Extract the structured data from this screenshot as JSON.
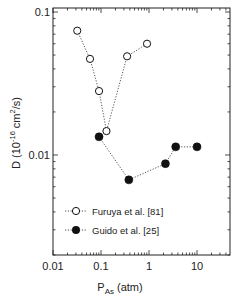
{
  "chart_data": {
    "type": "scatter",
    "title": "",
    "xlabel": "P_As (atm)",
    "xlabel_main": "P",
    "xlabel_sub": "As",
    "xlabel_unit": " (atm)",
    "ylabel": "D (10^-16 cm^2/s)",
    "ylabel_prefix": "D (10",
    "ylabel_exp": "-16",
    "ylabel_mid": " cm",
    "ylabel_sq": "2",
    "ylabel_suffix": "/s)",
    "xscale": "log",
    "yscale": "log",
    "xlim": [
      0.01,
      50
    ],
    "ylim": [
      0.002,
      0.11
    ],
    "xticks": [
      "0.01",
      "0.1",
      "1",
      "10"
    ],
    "xtick_values": [
      0.01,
      0.1,
      1,
      10
    ],
    "yticks": [
      "0.1",
      "0.01"
    ],
    "ytick_values": [
      0.1,
      0.01
    ],
    "grid": false,
    "legend_position": "lower left inside",
    "series": [
      {
        "name": "Furuya et al. [81]",
        "marker": "open-circle",
        "line": "dotted",
        "x": [
          0.032,
          0.059,
          0.091,
          0.13,
          0.35,
          0.91
        ],
        "y": [
          0.074,
          0.047,
          0.028,
          0.0147,
          0.049,
          0.06
        ]
      },
      {
        "name": "Guido et al. [25]",
        "marker": "filled-circle",
        "line": "dotted",
        "x": [
          0.091,
          0.38,
          2.2,
          3.6,
          10
        ],
        "y": [
          0.0134,
          0.0067,
          0.0087,
          0.0114,
          0.0114
        ]
      }
    ]
  },
  "colors": {
    "axis": "#222222",
    "marker": "#111111",
    "line": "#555555"
  }
}
